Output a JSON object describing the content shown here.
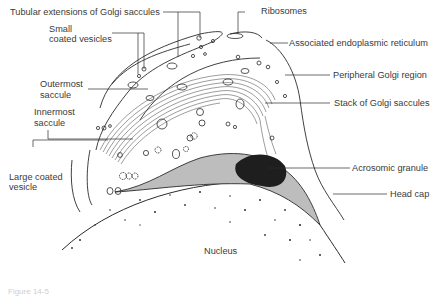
{
  "figure": {
    "labels": {
      "tubular_extensions": "Tubular extensions of Golgi saccules",
      "small_coated_vesicles_1": "Small",
      "small_coated_vesicles_2": "coated vesicles",
      "outermost_saccule_1": "Outermost",
      "outermost_saccule_2": "saccule",
      "innermost_saccule_1": "Innermost",
      "innermost_saccule_2": "saccule",
      "large_coated_vesicle_1": "Large coated",
      "large_coated_vesicle_2": "vesicle",
      "ribosomes": "Ribosomes",
      "associated_er": "Associated endoplasmic reticulum",
      "peripheral_golgi": "Peripheral Golgi region",
      "stack_of_golgi": "Stack of Golgi saccules",
      "acrosomic_granule": "Acrosomic granule",
      "head_cap": "Head cap",
      "nucleus": "Nucleus"
    },
    "caption": "Figure 14-5"
  },
  "colors": {
    "line": "#2b2b2b",
    "head_cap_fill": "#bdbdbd",
    "granule_fill": "#1e1e1e",
    "label_text": "#3a3a3a"
  }
}
